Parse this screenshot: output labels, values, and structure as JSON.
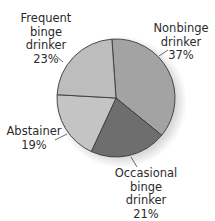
{
  "chart_data": {
    "type": "pie",
    "title": "",
    "start_angle_deg": -4,
    "direction": "clockwise",
    "slices": [
      {
        "label": "Nonbinge drinker",
        "label_lines": [
          "Nonbinge",
          "drinker",
          "37%"
        ],
        "value": 37,
        "color": "#a3a3a3"
      },
      {
        "label": "Occasional binge drinker",
        "label_lines": [
          "Occasional",
          "binge",
          "drinker",
          "21%"
        ],
        "value": 21,
        "color": "#6e6e6e"
      },
      {
        "label": "Abstainer",
        "label_lines": [
          "Abstainer",
          "19%"
        ],
        "value": 19,
        "color": "#c4c4c4"
      },
      {
        "label": "Frequent binge drinker",
        "label_lines": [
          "Frequent",
          "binge",
          "drinker",
          "23%"
        ],
        "value": 23,
        "color": "#bdbdbd"
      }
    ],
    "legend": "none (direct labels with leader lines)"
  },
  "labels": {
    "nonbinge": {
      "l1": "Nonbinge",
      "l2": "drinker",
      "l3": "37%"
    },
    "occasional": {
      "l1": "Occasional",
      "l2": "binge",
      "l3": "drinker",
      "l4": "21%"
    },
    "abstainer": {
      "l1": "Abstainer",
      "l2": "19%"
    },
    "frequent": {
      "l1": "Frequent",
      "l2": "binge",
      "l3": "drinker",
      "l4": "23%"
    }
  }
}
